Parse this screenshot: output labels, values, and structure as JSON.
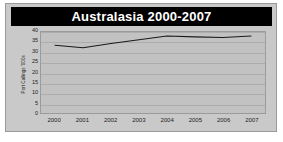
{
  "chart_data": {
    "type": "line",
    "title": "Australasia 2000-2007",
    "xlabel": "",
    "ylabel": "Port Callings '000s",
    "categories": [
      "2000",
      "2001",
      "2002",
      "2003",
      "2004",
      "2005",
      "2006",
      "2007"
    ],
    "values": [
      33.5,
      32.2,
      34.3,
      36.2,
      38.0,
      37.6,
      37.3,
      38.0
    ],
    "series": [
      {
        "name": "Port Callings",
        "values": [
          33.5,
          32.2,
          34.3,
          36.2,
          38.0,
          37.6,
          37.3,
          38.0
        ]
      }
    ],
    "ylim": [
      0,
      40
    ],
    "yticks": [
      0,
      5,
      10,
      15,
      20,
      25,
      30,
      35,
      40
    ],
    "ytick_labels": [
      "0",
      "5",
      "10",
      "15",
      "20",
      "25",
      "30",
      "35",
      "40"
    ],
    "grid": true,
    "legend": false,
    "legend_position": "none",
    "line_color": "#1a1a1a",
    "plot_background": "#c2c2c2",
    "figure_background": "#c9c9c9",
    "title_banner_color": "#000000",
    "title_text_color": "#ffffff"
  }
}
